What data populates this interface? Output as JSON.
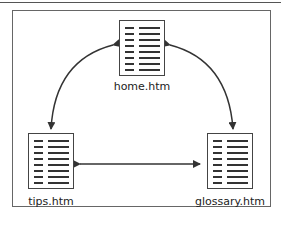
{
  "diagram": {
    "type": "site-link-diagram",
    "nodes": [
      {
        "id": "home",
        "label": "home.htm",
        "icon": "document-icon"
      },
      {
        "id": "tips",
        "label": "tips.htm",
        "icon": "document-icon"
      },
      {
        "id": "glossary",
        "label": "glossary.htm",
        "icon": "document-icon"
      }
    ],
    "edges": [
      {
        "from": "home",
        "to": "tips",
        "direction": "bidirectional"
      },
      {
        "from": "home",
        "to": "glossary",
        "direction": "bidirectional"
      },
      {
        "from": "tips",
        "to": "glossary",
        "direction": "bidirectional"
      }
    ]
  }
}
